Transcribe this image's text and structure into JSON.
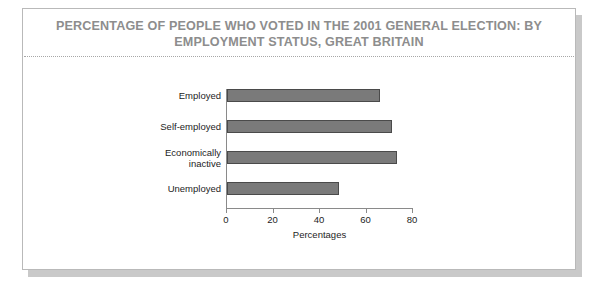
{
  "figure": {
    "title": "PERCENTAGE OF PEOPLE WHO VOTED IN THE 2001 GENERAL ELECTION: BY EMPLOYMENT STATUS, GREAT BRITAIN",
    "title_color": "#8d8d8d",
    "card_background": "#ffffff",
    "card_border_color": "#b9b9b9",
    "shadow_color": "#c9c9c9"
  },
  "chart_data": {
    "type": "bar",
    "orientation": "horizontal",
    "title": "PERCENTAGE OF PEOPLE WHO VOTED IN THE 2001 GENERAL ELECTION: BY EMPLOYMENT STATUS, GREAT BRITAIN",
    "categories": [
      "Employed",
      "Self-employed",
      "Economically\ninactive",
      "Unemployed"
    ],
    "values": [
      66,
      71,
      73,
      48
    ],
    "series": [
      {
        "name": "Percentage voted",
        "values": [
          66,
          71,
          73,
          48
        ]
      }
    ],
    "xlabel": "Percentages",
    "ylabel": "",
    "xlim": [
      0,
      80
    ],
    "xticks": [
      0,
      20,
      40,
      60,
      80
    ],
    "xtick_labels": [
      "0",
      "20",
      "40",
      "60",
      "80"
    ],
    "grid": false,
    "legend": false,
    "bar_fill_color": "#7a7a7a",
    "bar_edge_color": "#4a4a4a",
    "axis_color": "#8a8a8a",
    "tick_label_color": "#1d1d1d"
  }
}
